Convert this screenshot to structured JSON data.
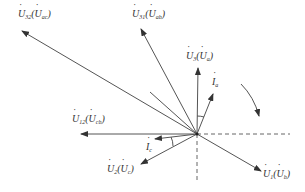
{
  "diagram": {
    "title": "",
    "center": {
      "x": 197,
      "y": 134
    },
    "phasors": [
      {
        "id": "U32",
        "main": "U",
        "main_sub": "32",
        "alt": "U",
        "alt_sub": "ac",
        "tip": {
          "x": 22,
          "y": 31
        },
        "label_pos": {
          "x": 18,
          "y": 9
        }
      },
      {
        "id": "U31",
        "main": "U",
        "main_sub": "31",
        "alt": "U",
        "alt_sub": "ab",
        "tip": {
          "x": 141,
          "y": 29
        },
        "label_pos": {
          "x": 132,
          "y": 9
        }
      },
      {
        "id": "U3",
        "main": "U",
        "main_sub": "3",
        "alt": "U",
        "alt_sub": "a",
        "tip": {
          "x": 198,
          "y": 68
        },
        "label_pos": {
          "x": 186,
          "y": 51
        }
      },
      {
        "id": "Ia",
        "main": "I",
        "main_sub": "a",
        "alt": "",
        "alt_sub": "",
        "tip": {
          "x": 213,
          "y": 94
        },
        "label_pos": {
          "x": 212,
          "y": 77
        }
      },
      {
        "id": "U12",
        "main": "U",
        "main_sub": "12",
        "alt": "U",
        "alt_sub": "cb",
        "tip": {
          "x": 81,
          "y": 134
        },
        "label_pos": {
          "x": 72,
          "y": 114
        }
      },
      {
        "id": "Ic",
        "main": "I",
        "main_sub": "c",
        "alt": "",
        "alt_sub": "",
        "tip": {
          "x": 155,
          "y": 139
        },
        "label_pos": {
          "x": 146,
          "y": 142
        }
      },
      {
        "id": "U2",
        "main": "U",
        "main_sub": "2",
        "alt": "U",
        "alt_sub": "c",
        "tip": {
          "x": 141,
          "y": 164
        },
        "label_pos": {
          "x": 107,
          "y": 164
        }
      },
      {
        "id": "U1",
        "main": "U",
        "main_sub": "1",
        "alt": "U",
        "alt_sub": "b",
        "tip": {
          "x": 261,
          "y": 171
        },
        "label_pos": {
          "x": 263,
          "y": 169
        }
      }
    ],
    "reference_axes": {
      "horizontal_dashed_end": {
        "x": 290,
        "y": 134
      },
      "vertical_dashed_end": {
        "x": 197,
        "y": 182
      }
    },
    "rotation_arrow": {
      "direction": "clockwise",
      "start": {
        "x": 241,
        "y": 84
      },
      "end": {
        "x": 259,
        "y": 116
      }
    },
    "colors": {
      "line": "#555555",
      "text": "#333333",
      "background": "#ffffff"
    }
  }
}
